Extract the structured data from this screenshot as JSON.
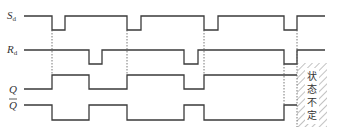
{
  "diagram": {
    "type": "timing-diagram",
    "signals": [
      {
        "name": "Sd_bar",
        "label": "S",
        "subscript": "d",
        "overbar": false,
        "initial": 1,
        "transitions": [
          [
            1,
            0
          ],
          [
            2,
            1
          ],
          [
            5,
            0
          ],
          [
            6,
            1
          ],
          [
            9,
            0
          ],
          [
            10,
            1
          ]
        ]
      },
      {
        "name": "Rd_bar",
        "label": "R",
        "subscript": "d",
        "overbar": false,
        "initial": 1,
        "transitions": [
          [
            3,
            0
          ],
          [
            4,
            1
          ],
          [
            7,
            0
          ],
          [
            8,
            1
          ],
          [
            9,
            0
          ],
          [
            10,
            1
          ]
        ]
      },
      {
        "name": "Q",
        "label": "Q",
        "subscript": "",
        "overbar": false,
        "initial": 0,
        "transitions": [
          [
            1,
            1
          ],
          [
            3,
            0
          ],
          [
            5,
            1
          ],
          [
            7,
            0
          ],
          [
            9,
            1
          ]
        ]
      },
      {
        "name": "Q_bar",
        "label": "Q",
        "subscript": "",
        "overbar": true,
        "initial": 1,
        "transitions": [
          [
            1,
            0
          ],
          [
            3,
            1
          ],
          [
            5,
            0
          ],
          [
            7,
            1
          ],
          [
            9,
            0
          ]
        ]
      }
    ],
    "undefined_region_note": "状态不定"
  }
}
